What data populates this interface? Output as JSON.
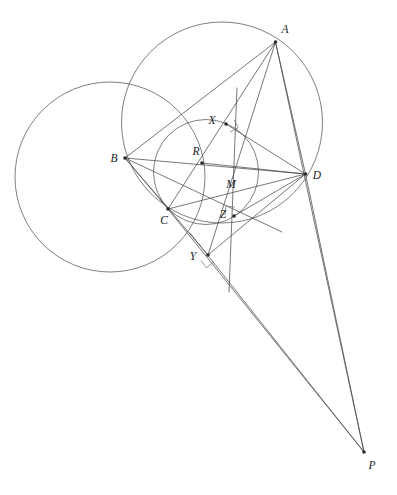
{
  "figure": {
    "background_color": "#ffffff",
    "line_color": "#4a4a4a",
    "label_color": "#1b1b1b",
    "width": 397,
    "height": 495
  },
  "points": [
    {
      "id": "A",
      "label": "A",
      "x": 275.5,
      "y": 42.0,
      "label_x": 285.0,
      "label_y": 33.0,
      "dot": true
    },
    {
      "id": "B",
      "label": "B",
      "x": 125.0,
      "y": 158.0,
      "label_x": 114.0,
      "label_y": 162.0,
      "dot": true
    },
    {
      "id": "C",
      "label": "C",
      "x": 168.0,
      "y": 209.0,
      "label_x": 164.0,
      "label_y": 224.0,
      "dot": true
    },
    {
      "id": "D",
      "label": "D",
      "x": 305.5,
      "y": 174.0,
      "label_x": 317.0,
      "label_y": 179.0,
      "dot": true
    },
    {
      "id": "P",
      "label": "P",
      "x": 364.0,
      "y": 452.0,
      "label_x": 372.0,
      "label_y": 469.0,
      "dot": true
    },
    {
      "id": "X",
      "label": "X",
      "x": 226.0,
      "y": 124.0,
      "label_x": 212.0,
      "label_y": 124.0,
      "dot": true
    },
    {
      "id": "Y",
      "label": "Y",
      "x": 208.0,
      "y": 255.0,
      "label_x": 193.0,
      "label_y": 260.0,
      "dot": true
    },
    {
      "id": "Z",
      "label": "Z",
      "x": 234.0,
      "y": 216.0,
      "label_x": 223.0,
      "label_y": 218.0,
      "dot": true
    },
    {
      "id": "R",
      "label": "R",
      "x": 202.0,
      "y": 163.0,
      "label_x": 196.0,
      "label_y": 155.0,
      "dot": true
    },
    {
      "id": "M",
      "label": "M",
      "x": 229.0,
      "y": 196.0,
      "label_x": 231.0,
      "label_y": 188.0,
      "dot": false
    }
  ],
  "circles": [
    {
      "id": "circumcircle-abcd",
      "name": "circumcircle-through-A-B-C-D",
      "cx": 222.0,
      "cy": 122.5,
      "r": 100.5
    },
    {
      "id": "left-circle",
      "name": "left-circle-through-B-C",
      "cx": 110.0,
      "cy": 177.0,
      "r": 95.0
    },
    {
      "id": "pedal-circle",
      "name": "pedal-circle-through-X-Z-C",
      "cx": 206.0,
      "cy": 172.0,
      "r": 52.5
    }
  ],
  "segments": [
    {
      "id": "AB",
      "name": "segment-A-B",
      "x1": 275.5,
      "y1": 42.0,
      "x2": 125.0,
      "y2": 158.0
    },
    {
      "id": "AC",
      "name": "segment-A-C",
      "x1": 275.5,
      "y1": 42.0,
      "x2": 168.0,
      "y2": 209.0
    },
    {
      "id": "AD",
      "name": "segment-A-D",
      "x1": 275.5,
      "y1": 42.0,
      "x2": 305.5,
      "y2": 174.0
    },
    {
      "id": "AY",
      "name": "segment-A-Y",
      "x1": 275.5,
      "y1": 42.0,
      "x2": 208.0,
      "y2": 255.0
    },
    {
      "id": "BD",
      "name": "segment-B-D",
      "x1": 125.0,
      "y1": 158.0,
      "x2": 305.5,
      "y2": 174.0
    },
    {
      "id": "BC",
      "name": "segment-B-C",
      "x1": 125.0,
      "y1": 158.0,
      "x2": 168.0,
      "y2": 209.0
    },
    {
      "id": "CD",
      "name": "segment-C-D",
      "x1": 168.0,
      "y1": 209.0,
      "x2": 305.5,
      "y2": 174.0
    },
    {
      "id": "XD",
      "name": "segment-X-D",
      "x1": 226.0,
      "y1": 124.0,
      "x2": 305.5,
      "y2": 174.0
    },
    {
      "id": "ZD",
      "name": "segment-Z-D",
      "x1": 234.0,
      "y1": 216.0,
      "x2": 305.5,
      "y2": 174.0
    },
    {
      "id": "YD",
      "name": "segment-Y-D",
      "x1": 208.0,
      "y1": 255.0,
      "x2": 305.5,
      "y2": 174.0
    },
    {
      "id": "RD",
      "name": "segment-R-D",
      "x1": 202.0,
      "y1": 163.0,
      "x2": 305.5,
      "y2": 174.0
    },
    {
      "id": "BY",
      "name": "segment-B-Y",
      "x1": 125.0,
      "y1": 158.0,
      "x2": 208.0,
      "y2": 255.0
    },
    {
      "id": "AP",
      "name": "segment-A-P",
      "x1": 275.5,
      "y1": 42.0,
      "x2": 364.0,
      "y2": 452.0
    },
    {
      "id": "DP",
      "name": "segment-D-P",
      "x1": 305.5,
      "y1": 174.0,
      "x2": 364.0,
      "y2": 452.0
    },
    {
      "id": "CP",
      "name": "segment-C-P-through-Z",
      "x1": 168.0,
      "y1": 209.0,
      "x2": 364.0,
      "y2": 452.0
    },
    {
      "id": "YP",
      "name": "segment-Y-P",
      "x1": 190.0,
      "y1": 233.0,
      "x2": 364.0,
      "y2": 452.0
    },
    {
      "id": "BXP",
      "name": "segment-B-X-extended",
      "x1": 125.0,
      "y1": 158.0,
      "x2": 282.0,
      "y2": 232.0
    },
    {
      "id": "XY",
      "name": "segment-X-Y-extended",
      "x1": 237.0,
      "y1": 88.0,
      "x2": 229.0,
      "y2": 292.0
    }
  ],
  "right_angle_marks": [
    {
      "id": "ra-X",
      "name": "right-angle-at-X",
      "x": 226.0,
      "y": 124.0,
      "a1": -28,
      "a2": 62,
      "size": 9
    },
    {
      "id": "ra-Y",
      "name": "right-angle-at-Y",
      "x": 208.0,
      "y": 255.0,
      "a1": 52,
      "a2": 142,
      "size": 9
    },
    {
      "id": "ra-Z",
      "name": "right-angle-at-Z",
      "x": 234.0,
      "y": 216.0,
      "a1": 186,
      "a2": 276,
      "size": 9
    }
  ]
}
